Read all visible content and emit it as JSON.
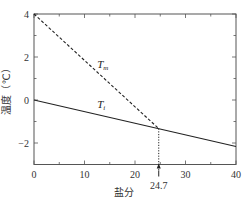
{
  "chart_data": {
    "type": "line",
    "title": "",
    "xlabel": "盐分",
    "ylabel": "温度（℃）",
    "xlim": [
      0,
      40
    ],
    "ylim": [
      -3,
      4
    ],
    "xticks": [
      0,
      10,
      20,
      30,
      40
    ],
    "yticks": [
      -2,
      0,
      2,
      4
    ],
    "grid": false,
    "series": [
      {
        "name": "T_m",
        "label_main": "T",
        "label_sub": "m",
        "style": "dashed",
        "x": [
          0,
          24.7
        ],
        "y": [
          4,
          -1.33
        ],
        "label_at": [
          12.5,
          1.5
        ]
      },
      {
        "name": "T_i",
        "label_main": "T",
        "label_sub": "i",
        "style": "solid",
        "x": [
          0,
          40
        ],
        "y": [
          0,
          -2.16
        ],
        "label_at": [
          12.5,
          -0.35
        ]
      }
    ],
    "annotations": [
      {
        "type": "vertical-dotted",
        "x": 24.7,
        "y_from": -1.33,
        "y_to": -3,
        "label": "24.7",
        "arrow": true
      }
    ]
  }
}
